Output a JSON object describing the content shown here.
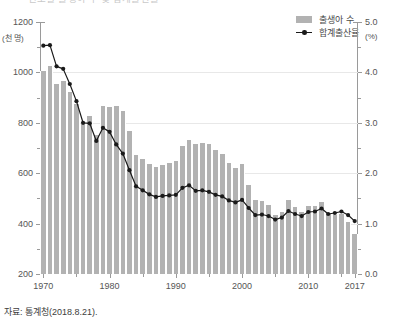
{
  "title_clipped": "연도별 출생아 수 및 합계출산율",
  "source_note": "자료: 통계청(2018.8.21).",
  "legend": {
    "position": "top-right",
    "items": [
      {
        "label": "출생아 수",
        "marker": "bar-swatch-icon",
        "color": "#b2b2b2"
      },
      {
        "label": "합계출산율",
        "marker": "line-marker-icon",
        "color": "#1a1a1a"
      }
    ]
  },
  "axes": {
    "left": {
      "unit": "(천 명)",
      "ticks": [
        "1200",
        "1000",
        "800",
        "600",
        "400",
        "200"
      ],
      "min": 200,
      "max": 1200
    },
    "right": {
      "unit": "(%)",
      "ticks": [
        "5.0",
        "4.0",
        "3.0",
        "2.0",
        "1.0",
        "0.0"
      ],
      "min": 0.0,
      "max": 5.0
    },
    "bottom": {
      "ticks": [
        "1970",
        "1980",
        "1990",
        "2000",
        "2010",
        "2017"
      ]
    }
  },
  "chart_data": {
    "type": "bar",
    "title": "연도별 출생아 수 및 합계출산율",
    "xlabel": "",
    "ylabel": "(천 명)",
    "y2label": "(%)",
    "ylim": [
      200,
      1200
    ],
    "y2lim": [
      0.0,
      5.0
    ],
    "grid": true,
    "legend_position": "top-right",
    "categories": [
      "1970",
      "1971",
      "1972",
      "1973",
      "1974",
      "1975",
      "1976",
      "1977",
      "1978",
      "1979",
      "1980",
      "1981",
      "1982",
      "1983",
      "1984",
      "1985",
      "1986",
      "1987",
      "1988",
      "1989",
      "1990",
      "1991",
      "1992",
      "1993",
      "1994",
      "1995",
      "1996",
      "1997",
      "1998",
      "1999",
      "2000",
      "2001",
      "2002",
      "2003",
      "2004",
      "2005",
      "2006",
      "2007",
      "2008",
      "2009",
      "2010",
      "2011",
      "2012",
      "2013",
      "2014",
      "2015",
      "2016",
      "2017"
    ],
    "series": [
      {
        "name": "출생아 수",
        "type": "bar",
        "axis": "left",
        "unit": "천 명",
        "color": "#b2b2b2",
        "values": [
          1007,
          1025,
          953,
          966,
          923,
          874,
          797,
          826,
          751,
          865,
          863,
          867,
          848,
          769,
          674,
          655,
          636,
          624,
          633,
          640,
          650,
          709,
          731,
          716,
          721,
          715,
          691,
          675,
          641,
          620,
          637,
          555,
          492,
          491,
          473,
          435,
          448,
          493,
          466,
          445,
          470,
          471,
          485,
          437,
          435,
          438,
          406,
          357
        ]
      },
      {
        "name": "합계출산율",
        "type": "line",
        "axis": "right",
        "unit": "%",
        "color": "#1a1a1a",
        "values": [
          4.53,
          4.54,
          4.12,
          4.07,
          3.77,
          3.43,
          3.0,
          2.99,
          2.64,
          2.9,
          2.82,
          2.57,
          2.39,
          2.06,
          1.74,
          1.66,
          1.58,
          1.53,
          1.55,
          1.56,
          1.57,
          1.71,
          1.76,
          1.65,
          1.66,
          1.63,
          1.57,
          1.54,
          1.46,
          1.42,
          1.47,
          1.31,
          1.17,
          1.18,
          1.15,
          1.08,
          1.12,
          1.25,
          1.19,
          1.15,
          1.23,
          1.24,
          1.3,
          1.19,
          1.21,
          1.24,
          1.17,
          1.05
        ]
      }
    ]
  }
}
